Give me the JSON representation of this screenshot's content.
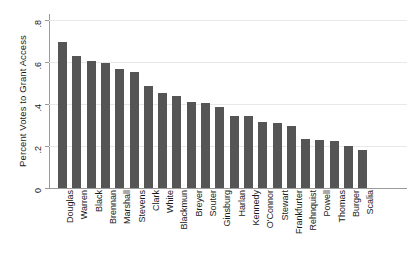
{
  "chart_data": {
    "type": "bar",
    "title": "",
    "xlabel": "",
    "ylabel": "Percent Votes to Grant Access",
    "ylim": [
      0,
      0.8
    ],
    "yticks": [
      "0",
      ".2",
      ".4",
      ".6",
      ".8"
    ],
    "ytick_values": [
      0,
      0.2,
      0.4,
      0.6,
      0.8
    ],
    "grid": true,
    "legend": false,
    "orientation": "vertical",
    "bar_color": "#555555",
    "categories": [
      "Douglas",
      "Warren",
      "Black",
      "Brennan",
      "Marshall",
      "Stevens",
      "Clark",
      "White",
      "Blackmun",
      "Breyer",
      "Souter",
      "Ginsburg",
      "Harlan",
      "Kennedy",
      "O'Connor",
      "Stewart",
      "Frankfurter",
      "Rehnquist",
      "Powell",
      "Thomas",
      "Burger",
      "Scalia"
    ],
    "values": [
      0.694,
      0.629,
      0.603,
      0.593,
      0.567,
      0.552,
      0.484,
      0.451,
      0.44,
      0.41,
      0.406,
      0.388,
      0.345,
      0.342,
      0.316,
      0.311,
      0.296,
      0.235,
      0.228,
      0.225,
      0.199,
      0.181
    ]
  }
}
